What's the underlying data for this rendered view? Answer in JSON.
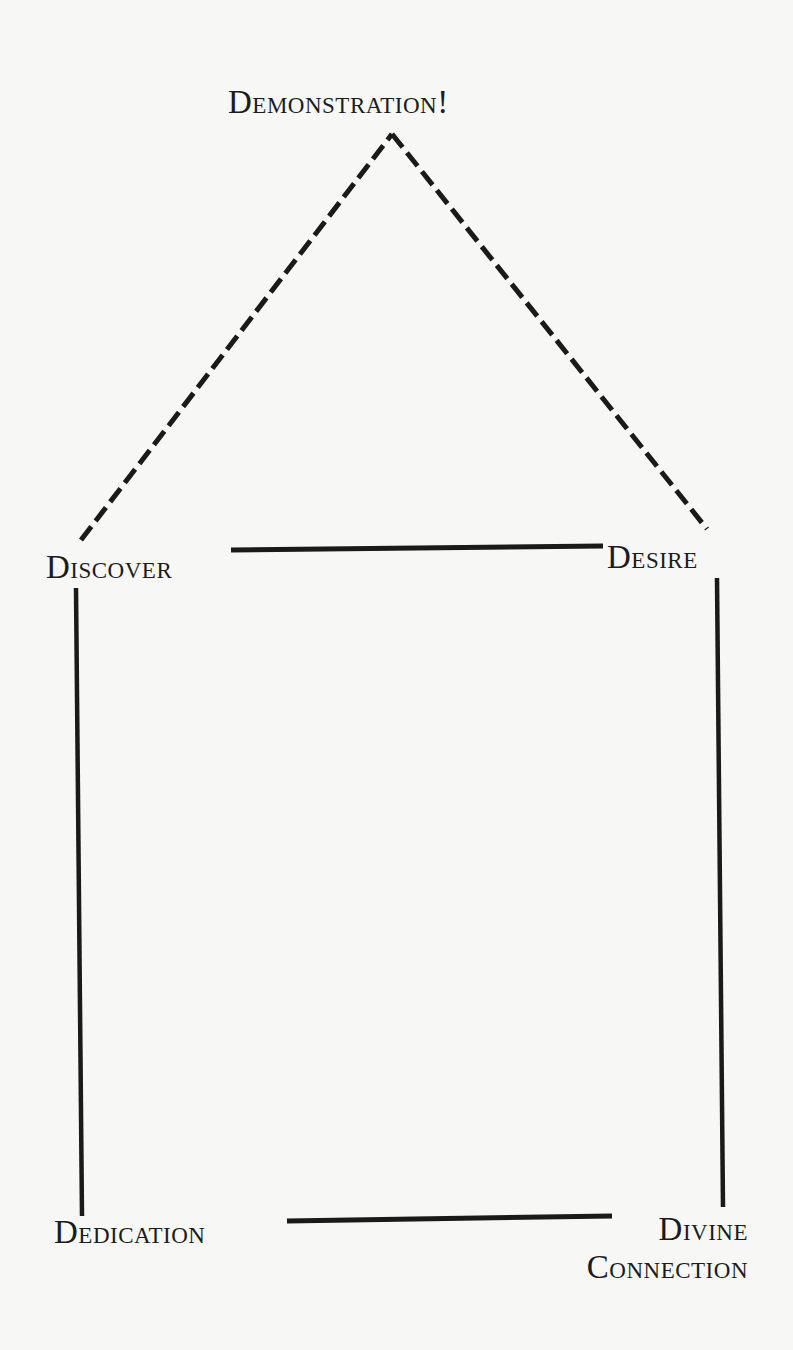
{
  "diagram": {
    "title": "Demonstration!",
    "nodes": [
      {
        "id": "demonstration",
        "label": "Demonstration!"
      },
      {
        "id": "discover",
        "label": "Discover"
      },
      {
        "id": "desire",
        "label": "Desire"
      },
      {
        "id": "dedication",
        "label": "Dedication"
      },
      {
        "id": "divine_connection",
        "label_line1": "Divine",
        "label_line2": "Connection"
      }
    ],
    "edges": [
      {
        "from": "discover",
        "to": "demonstration",
        "style": "dashed"
      },
      {
        "from": "desire",
        "to": "demonstration",
        "style": "dashed"
      },
      {
        "from": "discover",
        "to": "desire",
        "style": "solid"
      },
      {
        "from": "discover",
        "to": "dedication",
        "style": "solid"
      },
      {
        "from": "desire",
        "to": "divine_connection",
        "style": "solid"
      },
      {
        "from": "dedication",
        "to": "divine_connection",
        "style": "solid"
      }
    ],
    "colors": {
      "line": "#1a1a1a",
      "text": "#1c1c1c",
      "background": "#f7f7f5"
    }
  }
}
